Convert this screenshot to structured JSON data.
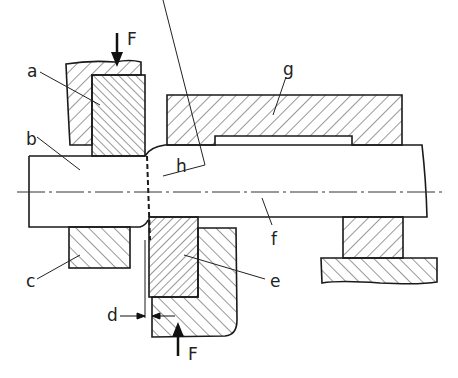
{
  "diagram": {
    "type": "technical-section-drawing",
    "labels": {
      "a": "a",
      "b": "b",
      "c": "c",
      "d": "d",
      "e": "e",
      "f": "f",
      "g": "g",
      "h": "h",
      "force_top": "F",
      "force_bottom": "F"
    },
    "colors": {
      "line": "#1a1a1a",
      "background": "#ffffff"
    }
  }
}
